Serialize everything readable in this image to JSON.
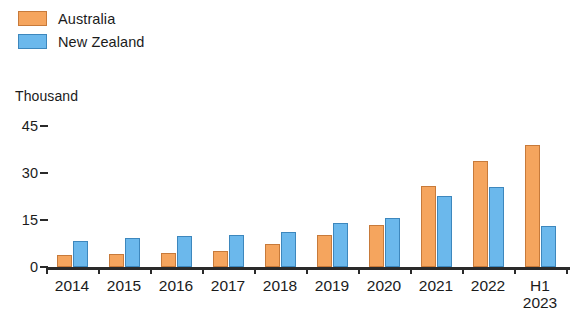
{
  "legend": {
    "items": [
      {
        "label": "Australia",
        "color": "#f5a55e",
        "border": "#c77a3a"
      },
      {
        "label": "New Zealand",
        "color": "#6bb8ec",
        "border": "#3d87bd"
      }
    ]
  },
  "axis": {
    "unit_label": "Thousand",
    "y_ticks": [
      "45",
      "30",
      "15",
      "0"
    ]
  },
  "chart_data": {
    "type": "bar",
    "title": "",
    "xlabel": "",
    "ylabel": "Thousand",
    "ylim": [
      0,
      45
    ],
    "yticks": [
      0,
      15,
      30,
      45
    ],
    "grid": false,
    "legend_position": "top-left",
    "categories": [
      "2014",
      "2015",
      "2016",
      "2017",
      "2018",
      "2019",
      "2020",
      "2021",
      "2022",
      "H1\n2023"
    ],
    "series": [
      {
        "name": "Australia",
        "color": "#f5a55e",
        "values": [
          3.8,
          4.2,
          4.6,
          5.2,
          7.2,
          10.2,
          13.4,
          26.0,
          33.8,
          38.8
        ]
      },
      {
        "name": "New Zealand",
        "color": "#6bb8ec",
        "values": [
          8.2,
          9.2,
          9.8,
          10.3,
          11.2,
          14.2,
          15.6,
          22.6,
          25.4,
          13.0
        ]
      }
    ]
  }
}
